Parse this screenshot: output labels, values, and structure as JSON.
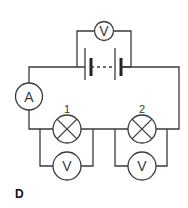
{
  "diagram": {
    "type": "circuit",
    "figure_label": "D",
    "colors": {
      "line": "#3a3a3a",
      "background": "#ffffff"
    },
    "supply": {
      "voltmeter_symbol": "V",
      "cells": 2,
      "connection": "dashed-between-cells"
    },
    "ammeter": {
      "symbol": "A"
    },
    "lamps": [
      {
        "label": "1",
        "voltmeter_symbol": "V"
      },
      {
        "label": "2",
        "voltmeter_symbol": "V"
      }
    ]
  }
}
